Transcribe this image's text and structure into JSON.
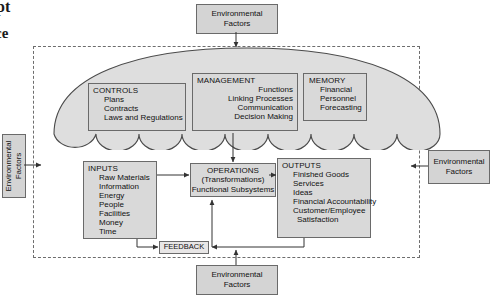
{
  "page": {
    "bleed_fragments": [
      "pt",
      "ce"
    ]
  },
  "diagram": {
    "environmental": {
      "top": "Environmental\nFactors",
      "top_line1": "Environmental",
      "top_line2": "Factors",
      "bottom_line1": "Environmental",
      "bottom_line2": "Factors",
      "right_line1": "Environmental",
      "right_line2": "Factors",
      "left_line1": "Environmental",
      "left_line2": "Factors"
    },
    "controls": {
      "header": "CONTROLS",
      "items": [
        "Plans",
        "Contracts",
        "Laws and Regulations"
      ]
    },
    "management": {
      "header": "MANAGEMENT",
      "items": [
        "Functions",
        "Linking Processes",
        "Communication",
        "Decision Making"
      ]
    },
    "memory": {
      "header": "MEMORY",
      "items": [
        "Financial",
        "Personnel",
        "Forecasting"
      ]
    },
    "inputs": {
      "header": "INPUTS",
      "items": [
        "Raw Materials",
        "Information",
        "Energy",
        "People",
        "Facilities",
        "Money",
        "Time"
      ]
    },
    "operations": {
      "line1": "OPERATIONS",
      "line2": "(Transformations)",
      "line3": "Functional Subsystems"
    },
    "outputs": {
      "header": "OUTPUTS",
      "items": [
        "Finished Goods",
        "Services",
        "Ideas",
        "Financial Accountability",
        "Customer/Employee",
        "Satisfaction"
      ]
    },
    "feedback": {
      "label": "FEEDBACK"
    },
    "colors": {
      "box_fill": "#d9d9d9",
      "box_stroke": "#6a6a6a",
      "umbrella_fill": "#dedede",
      "umbrella_stroke": "#4a4a4a",
      "boundary_stroke": "#6d6d6d",
      "connector": "#333333",
      "text": "#111111"
    }
  }
}
